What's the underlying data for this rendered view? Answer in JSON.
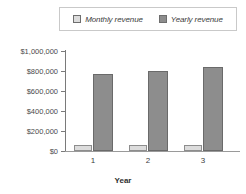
{
  "chart_data": {
    "type": "bar",
    "title": "",
    "xlabel": "Year",
    "ylabel": "",
    "categories": [
      "1",
      "2",
      "3"
    ],
    "series": [
      {
        "name": "Monthly revenue",
        "values": [
          58000,
          60000,
          62000
        ],
        "color": "#dcdcdc"
      },
      {
        "name": "Yearly revenue",
        "values": [
          765000,
          800000,
          835000
        ],
        "color": "#8d8d8d"
      }
    ],
    "ylim": [
      0,
      1000000
    ],
    "ytick_labels": [
      "$1,000,000",
      "$800,000",
      "$600,000",
      "$400,000",
      "$200,000",
      "$0"
    ],
    "ytick_values": [
      1000000,
      800000,
      600000,
      400000,
      200000,
      0
    ],
    "grid": false,
    "legend_position": "top"
  },
  "legend": {
    "entries": [
      {
        "label": "Monthly revenue",
        "color": "#dcdcdc"
      },
      {
        "label": "Yearly revenue",
        "color": "#8d8d8d"
      }
    ]
  },
  "axis": {
    "x_title": "Year",
    "x_ticks": [
      "1",
      "2",
      "3"
    ],
    "y_ticks": [
      "$1,000,000",
      "$800,000",
      "$600,000",
      "$400,000",
      "$200,000",
      "$0"
    ]
  }
}
